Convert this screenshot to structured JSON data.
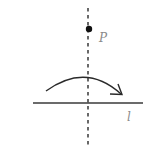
{
  "diagram": {
    "type": "geometry-reflection",
    "labels": {
      "point": "P",
      "line": "l"
    },
    "colors": {
      "stroke": "#2a2a2a",
      "line": "#3a3a3a",
      "label": "#8a8a8a",
      "background": "#ffffff"
    },
    "elements": {
      "axis_dashed_vertical": {
        "x": 88,
        "y1": 8,
        "y2": 146
      },
      "point_P": {
        "cx": 89,
        "cy": 29,
        "r": 3
      },
      "line_l": {
        "x1": 33,
        "x2": 143,
        "y": 103
      },
      "rotation_arrow": {
        "start": [
          46,
          91
        ],
        "peak": [
          88,
          78
        ],
        "end": [
          122,
          94
        ]
      }
    }
  }
}
